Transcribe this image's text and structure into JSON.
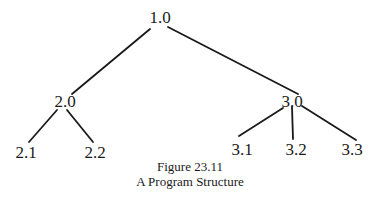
{
  "diagram": {
    "type": "tree",
    "nodes": [
      {
        "id": "1.0",
        "label": "1.0"
      },
      {
        "id": "2.0",
        "label": "2.0"
      },
      {
        "id": "3.0",
        "label": "3.0"
      },
      {
        "id": "2.1",
        "label": "2.1"
      },
      {
        "id": "2.2",
        "label": "2.2"
      },
      {
        "id": "3.1",
        "label": "3.1"
      },
      {
        "id": "3.2",
        "label": "3.2"
      },
      {
        "id": "3.3",
        "label": "3.3"
      }
    ],
    "edges": [
      [
        "1.0",
        "2.0"
      ],
      [
        "1.0",
        "3.0"
      ],
      [
        "2.0",
        "2.1"
      ],
      [
        "2.0",
        "2.2"
      ],
      [
        "3.0",
        "3.1"
      ],
      [
        "3.0",
        "3.2"
      ],
      [
        "3.0",
        "3.3"
      ]
    ]
  },
  "caption": {
    "figure_number": "Figure 23.11",
    "title": "A Program Structure"
  },
  "colors": {
    "line": "#1a1a1a",
    "background": "#ffffff"
  }
}
